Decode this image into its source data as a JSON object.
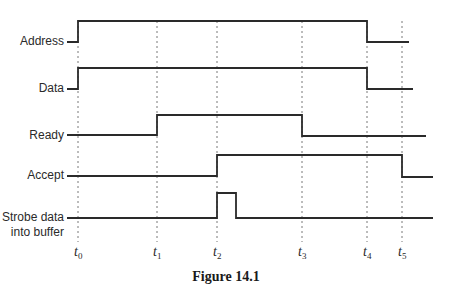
{
  "figure": {
    "caption": "Figure 14.1",
    "type": "timing-diagram"
  },
  "time_markers": [
    {
      "name": "t",
      "sub": "0",
      "x": 78
    },
    {
      "name": "t",
      "sub": "1",
      "x": 157
    },
    {
      "name": "t",
      "sub": "2",
      "x": 217
    },
    {
      "name": "t",
      "sub": "3",
      "x": 302
    },
    {
      "name": "t",
      "sub": "4",
      "x": 367
    },
    {
      "name": "t",
      "sub": "5",
      "x": 402
    }
  ],
  "signals": [
    {
      "label_lines": [
        "Address"
      ],
      "label_y": 45,
      "points": [
        [
          67,
          42
        ],
        [
          78,
          42
        ],
        [
          78,
          21
        ],
        [
          367,
          21
        ],
        [
          367,
          42
        ],
        [
          409,
          42
        ]
      ],
      "transitions": "high at t0, low at t4"
    },
    {
      "label_lines": [
        "Data"
      ],
      "label_y": 92,
      "points": [
        [
          67,
          89
        ],
        [
          78,
          89
        ],
        [
          78,
          68
        ],
        [
          367,
          68
        ],
        [
          367,
          89
        ],
        [
          413,
          89
        ]
      ],
      "transitions": "high at t0, low at t4"
    },
    {
      "label_lines": [
        "Ready"
      ],
      "label_y": 139,
      "points": [
        [
          67,
          135
        ],
        [
          157,
          135
        ],
        [
          157,
          115
        ],
        [
          302,
          115
        ],
        [
          302,
          136
        ],
        [
          426,
          136
        ]
      ],
      "transitions": "high at t1, low at t3"
    },
    {
      "label_lines": [
        "Accept"
      ],
      "label_y": 179,
      "points": [
        [
          67,
          176
        ],
        [
          217,
          176
        ],
        [
          217,
          155
        ],
        [
          402,
          155
        ],
        [
          402,
          177
        ],
        [
          433,
          177
        ]
      ],
      "transitions": "high at t2, low at t5"
    },
    {
      "label_lines": [
        "Strobe data",
        "into buffer"
      ],
      "label_y": 221,
      "points": [
        [
          67,
          218
        ],
        [
          217,
          218
        ],
        [
          217,
          193
        ],
        [
          236,
          193
        ],
        [
          236,
          218
        ],
        [
          433,
          218
        ]
      ],
      "transitions": "short pulse beginning at t2"
    }
  ],
  "layout": {
    "label_right_x": 64,
    "guide_top": 21,
    "guide_bottom": 242,
    "marker_label_y": 256,
    "caption_x": 226,
    "caption_y": 281,
    "line_color": "#2a2a2a",
    "guide_color": "#6a6a6a"
  }
}
